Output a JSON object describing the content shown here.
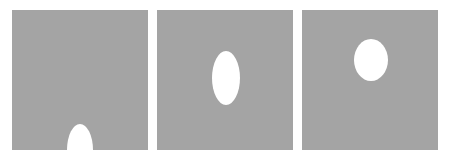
{
  "colors": {
    "background": "#ffffff",
    "panel_fill": "#a4a4a4",
    "shape_fill": "#ffffff"
  },
  "panels": [
    {
      "label": "",
      "left": 12,
      "shape": {
        "type": "ellipse",
        "cx": 68,
        "cy": 140,
        "rx": 13,
        "ry": 26
      }
    },
    {
      "label": "",
      "left": 157,
      "shape": {
        "type": "ellipse",
        "cx": 69,
        "cy": 68,
        "rx": 14,
        "ry": 27
      }
    },
    {
      "label": "",
      "left": 302,
      "shape": {
        "type": "ellipse",
        "cx": 69,
        "cy": 50,
        "rx": 17,
        "ry": 21
      }
    }
  ]
}
